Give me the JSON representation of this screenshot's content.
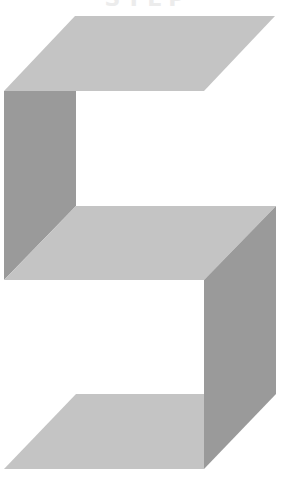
{
  "figure": {
    "cropped_caption": "STEP",
    "glyph": "S",
    "colors": {
      "background": "#ffffff",
      "light_face": "#c4c4c4",
      "dark_face": "#9a9a9a",
      "caption": "#ececec"
    },
    "faces": [
      {
        "name": "top-face",
        "tone": "light",
        "points": "75,16 275,16 204,91 4,91"
      },
      {
        "name": "left-side-face",
        "tone": "dark",
        "points": "4,91 76,91 76,206 4,280"
      },
      {
        "name": "middle-face",
        "tone": "light",
        "points": "76,206 276,206 204,280 4,280"
      },
      {
        "name": "right-side-face",
        "tone": "dark",
        "points": "204,280 276,206 276,394 204,469"
      },
      {
        "name": "bottom-face",
        "tone": "light",
        "points": "76,394 204,394 204,469 4,469"
      }
    ]
  }
}
